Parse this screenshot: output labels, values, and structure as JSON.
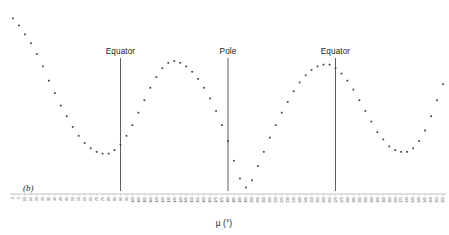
{
  "panel": {
    "label": "(b)"
  },
  "axis": {
    "x_title": "μ (°)",
    "x_min": 0,
    "x_max": 360,
    "x_tick_step": 5,
    "x_tick_labels": [
      "0",
      "5",
      "10",
      "15",
      "20",
      "25",
      "30",
      "35",
      "40",
      "45",
      "50",
      "55",
      "60",
      "65",
      "70",
      "75",
      "80",
      "85",
      "90",
      "95",
      "100",
      "105",
      "110",
      "115",
      "120",
      "125",
      "130",
      "135",
      "140",
      "145",
      "150",
      "155",
      "160",
      "165",
      "170",
      "175",
      "180",
      "185",
      "190",
      "195",
      "200",
      "205",
      "210",
      "215",
      "220",
      "225",
      "230",
      "235",
      "240",
      "245",
      "250",
      "255",
      "260",
      "265",
      "270",
      "275",
      "280",
      "285",
      "290",
      "295",
      "300",
      "305",
      "310",
      "315",
      "320",
      "325",
      "330",
      "335",
      "340",
      "345",
      "350",
      "355",
      "360"
    ]
  },
  "annotations": [
    {
      "label": "Equator",
      "x": 90
    },
    {
      "label": "Pole",
      "x": 180
    },
    {
      "label": "Equator",
      "x": 270
    }
  ],
  "colors": {
    "point": "#3c3c3c",
    "marker_line": "#4a4a4a",
    "text": "#1a1a1a",
    "tick_text": "#4a4a4a",
    "background": "#ffffff"
  },
  "chart_data": {
    "type": "scatter",
    "title": "",
    "xlabel": "μ (°)",
    "ylabel": "",
    "xlim": [
      0,
      360
    ],
    "ylim": [
      0,
      100
    ],
    "grid": false,
    "legend": null,
    "x": [
      0,
      5,
      10,
      15,
      20,
      25,
      30,
      35,
      40,
      45,
      50,
      55,
      60,
      65,
      70,
      75,
      80,
      85,
      90,
      95,
      100,
      105,
      110,
      115,
      120,
      125,
      130,
      135,
      140,
      145,
      150,
      155,
      160,
      165,
      170,
      175,
      180,
      185,
      190,
      195,
      200,
      205,
      210,
      215,
      220,
      225,
      230,
      235,
      240,
      245,
      250,
      255,
      260,
      265,
      270,
      275,
      280,
      285,
      290,
      295,
      300,
      305,
      310,
      315,
      320,
      325,
      330,
      335,
      340,
      345,
      350,
      355,
      360
    ],
    "y": [
      97,
      93,
      88,
      83,
      77,
      70,
      62,
      55,
      48,
      42,
      36,
      31,
      27,
      24,
      22,
      21,
      21,
      23,
      26,
      31,
      37,
      44,
      51,
      58,
      64,
      69,
      72,
      73,
      72,
      70,
      67,
      63,
      58,
      52,
      45,
      37,
      28,
      17,
      7,
      2,
      6,
      14,
      22,
      30,
      37,
      44,
      50,
      56,
      61,
      65,
      68,
      70,
      71,
      71,
      69,
      66,
      62,
      57,
      51,
      45,
      39,
      33,
      29,
      25,
      23,
      22,
      22,
      24,
      28,
      34,
      42,
      51,
      60
    ],
    "series": [
      {
        "name": "brightness profile",
        "values": [
          97,
          93,
          88,
          83,
          77,
          70,
          62,
          55,
          48,
          42,
          36,
          31,
          27,
          24,
          22,
          21,
          21,
          23,
          26,
          31,
          37,
          44,
          51,
          58,
          64,
          69,
          72,
          73,
          72,
          70,
          67,
          63,
          58,
          52,
          45,
          37,
          28,
          17,
          7,
          2,
          6,
          14,
          22,
          30,
          37,
          44,
          50,
          56,
          61,
          65,
          68,
          70,
          71,
          71,
          69,
          66,
          62,
          57,
          51,
          45,
          39,
          33,
          29,
          25,
          23,
          22,
          22,
          24,
          28,
          34,
          42,
          51,
          60
        ]
      }
    ],
    "vertical_markers": [
      {
        "label": "Equator",
        "x": 90
      },
      {
        "label": "Pole",
        "x": 180
      },
      {
        "label": "Equator",
        "x": 270
      }
    ]
  }
}
